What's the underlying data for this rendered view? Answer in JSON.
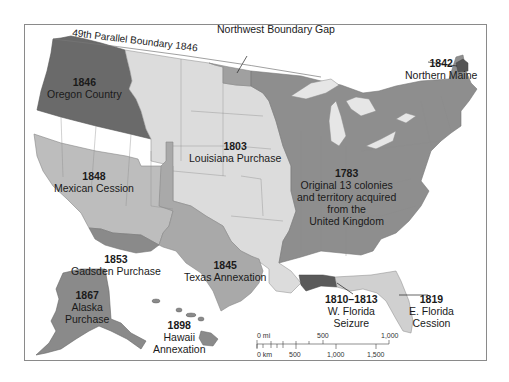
{
  "map": {
    "title": "Territorial Acquisitions of the United States",
    "colors": {
      "original13": "#8e8e8e",
      "louisiana": "#dcdcdc",
      "oregon": "#6a6a6a",
      "mexican_cession": "#bdbdbd",
      "texas": "#a9a9a9",
      "gadsden": "#8a8a8a",
      "northwest_gap": "#a0a0a0",
      "northern_maine": "#555555",
      "w_florida": "#5a5a5a",
      "e_florida": "#d0d0d0",
      "alaska": "#8a8a8a",
      "hawaii": "#8a8a8a",
      "water": "#ffffff",
      "lakes": "#e6e6e6",
      "frame": "#8a8a8a",
      "border_lines": "#7a7a7a"
    },
    "boundary_label": "49th Parallel Boundary 1846",
    "acquisitions": [
      {
        "id": "oregon",
        "year": "1846",
        "name": "Oregon Country"
      },
      {
        "id": "northwest_gap",
        "year": "1818",
        "name": "Northwest Boundary Gap"
      },
      {
        "id": "northern_maine",
        "year": "1842",
        "name": "Northern Maine"
      },
      {
        "id": "louisiana",
        "year": "1803",
        "name": "Louisiana Purchase"
      },
      {
        "id": "mexican_cession",
        "year": "1848",
        "name": "Mexican Cession"
      },
      {
        "id": "original13",
        "year": "1783",
        "name_lines": [
          "Original 13 colonies",
          "and territory acquired",
          "from the",
          "United Kingdom"
        ]
      },
      {
        "id": "gadsden",
        "year": "1853",
        "name": "Gadsden Purchase"
      },
      {
        "id": "texas",
        "year": "1845",
        "name": "Texas Annexation"
      },
      {
        "id": "alaska",
        "year": "1867",
        "name_lines": [
          "Alaska",
          "Purchase"
        ]
      },
      {
        "id": "hawaii",
        "year": "1898",
        "name_lines": [
          "Hawaii",
          "Annexation"
        ]
      },
      {
        "id": "w_florida",
        "year": "1810–1813",
        "name_lines": [
          "W. Florida",
          "Seizure"
        ]
      },
      {
        "id": "e_florida",
        "year": "1819",
        "name_lines": [
          "E. Florida",
          "Cession"
        ]
      }
    ],
    "scale_bar": {
      "miles_labels": [
        "0 mi",
        "500",
        "1,000"
      ],
      "km_labels": [
        "0 km",
        "500",
        "1,000",
        "1,500"
      ]
    }
  }
}
